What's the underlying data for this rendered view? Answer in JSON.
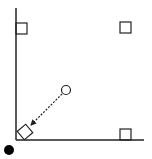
{
  "diagram": {
    "colors": {
      "stroke": "#222222",
      "fill_dot": "#000000",
      "background": "#ffffff"
    },
    "elements": {
      "wall": {
        "x1": 16,
        "y1": 8,
        "x2": 16,
        "y2": 140
      },
      "floor": {
        "x1": 16,
        "y1": 140,
        "x2": 144,
        "y2": 140
      },
      "square_top_left": {
        "x": 16,
        "y": 23,
        "size": 11
      },
      "square_top_right": {
        "x": 120,
        "y": 22,
        "size": 11
      },
      "square_bottom_right": {
        "x": 120,
        "y": 129,
        "size": 11
      },
      "rotated_square": {
        "cx": 25,
        "cy": 132,
        "size": 11,
        "angle": -40
      },
      "open_circle": {
        "cx": 66,
        "cy": 90,
        "r": 4.5
      },
      "dashed_arrow": {
        "x1": 62,
        "y1": 94,
        "x2": 31,
        "y2": 125
      },
      "filled_dot": {
        "cx": 9,
        "cy": 150,
        "r": 5
      }
    }
  }
}
